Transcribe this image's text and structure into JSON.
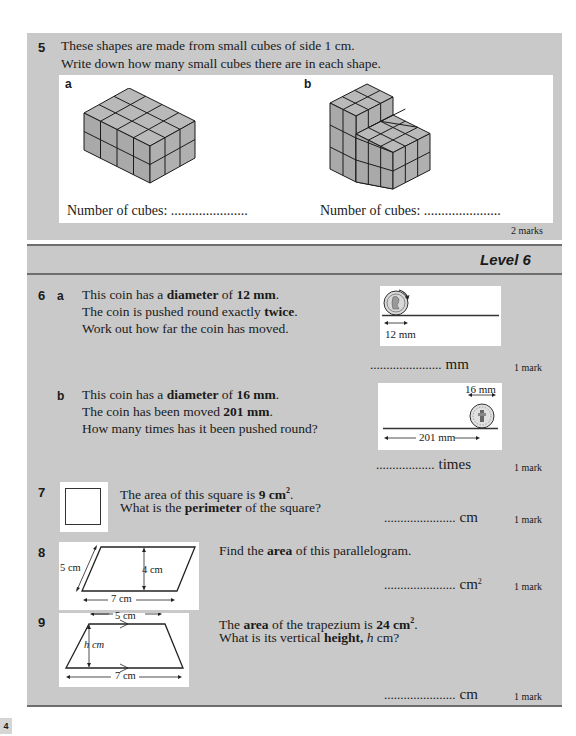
{
  "q5": {
    "number": "5",
    "line1": "These shapes are made from small cubes of side 1 cm.",
    "line2": "Write down how many small cubes there are in each shape.",
    "part_a": "a",
    "part_b": "b",
    "answer_label_a": "Number of cubes: ......................",
    "answer_label_b": "Number of cubes: ......................",
    "marks": "2 marks"
  },
  "level": {
    "label": "Level 6"
  },
  "q6": {
    "number": "6",
    "a": {
      "part": "a",
      "l1_pre": "This coin has a ",
      "l1_b1": "diameter",
      "l1_mid": " of ",
      "l1_b2": "12 mm",
      "l1_post": ".",
      "l2_pre": "The coin is pushed round exactly ",
      "l2_b": "twice",
      "l2_post": ".",
      "l3": "Work out how far the coin has moved.",
      "diagram_label": "12 mm",
      "answer_dots": "......................",
      "unit": "mm",
      "mark": "1 mark"
    },
    "b": {
      "part": "b",
      "l1_pre": "This coin has a ",
      "l1_b1": "diameter",
      "l1_mid": " of ",
      "l1_b2": "16 mm",
      "l1_post": ".",
      "l2_pre": "The coin has been moved ",
      "l2_b": "201 mm",
      "l2_post": ".",
      "l3": "How many times has it been pushed round?",
      "diagram_diameter": "16 mm",
      "diagram_distance": "201 mm",
      "answer_dots": "..................",
      "unit": "times",
      "mark": "1 mark"
    }
  },
  "q7": {
    "number": "7",
    "l1_pre": "The area of this square is ",
    "l1_b": "9 cm",
    "l1_sup": "2",
    "l1_post": ".",
    "l2_pre": "What is the ",
    "l2_b": "perimeter",
    "l2_post": " of the square?",
    "answer_dots": "......................",
    "unit": "cm",
    "mark": "1 mark"
  },
  "q8": {
    "number": "8",
    "l1_pre": "Find the ",
    "l1_b": "area",
    "l1_post": " of this parallelogram.",
    "side_label": "5 cm",
    "height_label": "4 cm",
    "base_label": "7 cm",
    "answer_dots": "......................",
    "unit": "cm",
    "unit_sup": "2",
    "mark": "1 mark"
  },
  "q9": {
    "number": "9",
    "l1_pre": "The ",
    "l1_b1": "area",
    "l1_mid": " of the trapezium is ",
    "l1_b2": "24 cm",
    "l1_sup": "2",
    "l1_post": ".",
    "l2_pre": "What is its vertical ",
    "l2_b": "height,",
    "l2_i": " h",
    "l2_post": " cm?",
    "top_label": "5 cm",
    "height_label": "h cm",
    "base_label": "7 cm",
    "answer_dots": "......................",
    "unit": "cm",
    "mark": "1 mark"
  },
  "page": {
    "number": "4"
  }
}
